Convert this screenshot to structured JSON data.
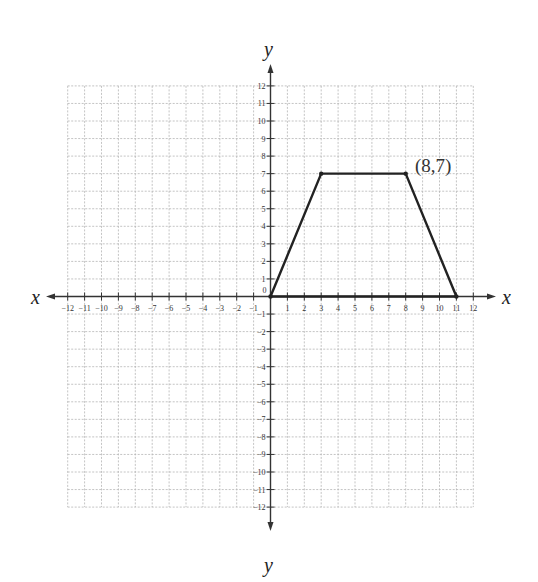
{
  "chart_data": {
    "type": "line",
    "title": "",
    "xlabel": "x",
    "ylabel": "y",
    "xlim": [
      -12,
      12
    ],
    "ylim": [
      -12,
      12
    ],
    "grid": true,
    "grid_style": "dashed",
    "xticks": [
      -12,
      -11,
      -10,
      -9,
      -8,
      -7,
      -6,
      -5,
      -4,
      -3,
      -2,
      -1,
      1,
      2,
      3,
      4,
      5,
      6,
      7,
      8,
      9,
      10,
      11,
      12
    ],
    "yticks": [
      -12,
      -11,
      -10,
      -9,
      -8,
      -7,
      -6,
      -5,
      -4,
      -3,
      -2,
      -1,
      1,
      2,
      3,
      4,
      5,
      6,
      7,
      8,
      9,
      10,
      11,
      12
    ],
    "origin_label": "0",
    "series": [
      {
        "name": "trapezoid",
        "closed": true,
        "points": [
          [
            0,
            0
          ],
          [
            3,
            7
          ],
          [
            8,
            7
          ],
          [
            11,
            0
          ]
        ],
        "color": "#222222"
      }
    ],
    "annotations": [
      {
        "text": "(8,7)",
        "x": 8,
        "y": 7
      }
    ],
    "legend": null
  },
  "labels": {
    "x_left": "x",
    "x_right": "x",
    "y_top": "y",
    "y_bottom": "y",
    "origin": "0",
    "point_annotation": "(8,7)"
  }
}
